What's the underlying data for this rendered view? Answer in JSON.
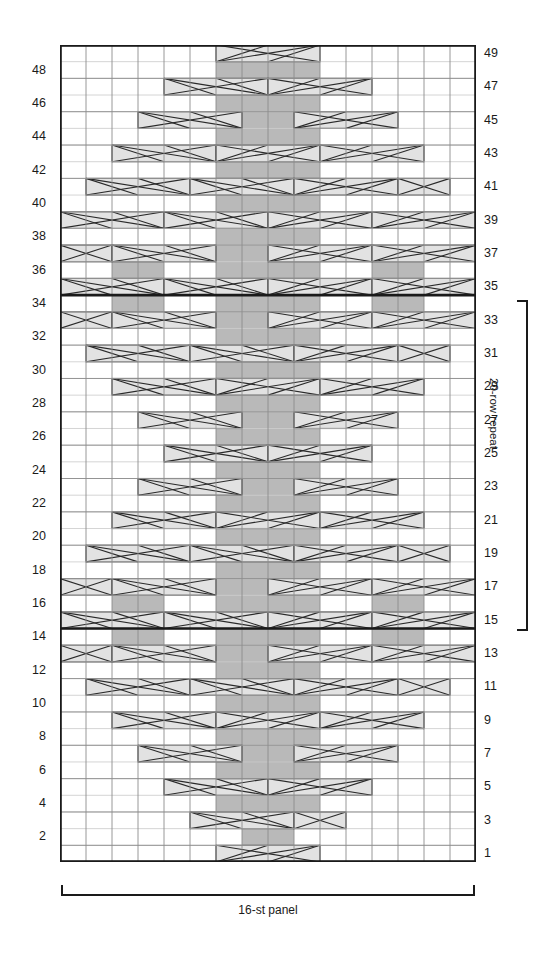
{
  "figure": {
    "kind": "knitting-cable-chart",
    "columns": 16,
    "rows": 49
  },
  "axis": {
    "left_labels": [
      48,
      46,
      44,
      42,
      40,
      38,
      36,
      34,
      32,
      30,
      28,
      26,
      24,
      22,
      20,
      18,
      16,
      14,
      12,
      10,
      8,
      6,
      4,
      2
    ],
    "right_labels": [
      49,
      47,
      45,
      43,
      41,
      39,
      37,
      35,
      33,
      31,
      29,
      27,
      25,
      23,
      21,
      19,
      17,
      15,
      13,
      11,
      9,
      7,
      5,
      3,
      1
    ]
  },
  "annotations": {
    "repeat_label": "20-row repeat",
    "panel_label": "16-st panel",
    "repeat_start_row": 15,
    "repeat_end_row": 34
  },
  "colors": {
    "grid_line": "#8c8c8c",
    "grid_line_minor": "#c9c9c9",
    "border": "#1a1a1a",
    "repeat_rule": "#1a1a1a",
    "knit_fill": "#b9b9b9",
    "cable_fill": "#e2e2e2",
    "symbol_stroke": "#2a2a2a",
    "text": "#1a1a1a",
    "background": "#ffffff"
  },
  "chart_data": {
    "type": "heatmap",
    "title": "",
    "xlabel": "16-st panel",
    "ylabel": "",
    "grid": true,
    "legend": "none",
    "columns": 16,
    "rows": 49,
    "row_order": "bottom-to-top",
    "symbol_key": {
      "blank": "purl / background stitch",
      "k": "knit stitch (shaded cell)",
      "c4f": "2-over-2 cable, left cross (4 cells)",
      "c4b": "2-over-2 cable, right cross (4 cells)",
      "t2f": "1-over-1 twist, left (2 cells)",
      "t2b": "1-over-1 twist, right (2 cells)"
    },
    "knit_cells": [
      {
        "row": 49,
        "cols": []
      },
      {
        "row": 48,
        "cols": [
          7,
          8,
          9,
          10
        ]
      },
      {
        "row": 47,
        "cols": [
          7,
          8,
          9,
          10
        ]
      },
      {
        "row": 46,
        "cols": [
          7,
          8,
          9,
          10
        ]
      },
      {
        "row": 45,
        "cols": [
          7,
          8,
          9,
          10
        ]
      },
      {
        "row": 44,
        "cols": [
          7,
          8,
          9,
          10
        ]
      },
      {
        "row": 43,
        "cols": [
          7,
          8,
          9,
          10
        ]
      },
      {
        "row": 42,
        "cols": [
          7,
          8,
          9,
          10
        ]
      },
      {
        "row": 41,
        "cols": [
          7,
          8,
          9,
          10
        ]
      },
      {
        "row": 40,
        "cols": [
          7,
          8,
          9,
          10
        ]
      },
      {
        "row": 39,
        "cols": [
          7,
          8,
          9,
          10
        ]
      },
      {
        "row": 38,
        "cols": [
          7,
          8,
          9,
          10
        ]
      },
      {
        "row": 37,
        "cols": [
          7,
          8,
          9,
          10
        ]
      },
      {
        "row": 36,
        "cols": [
          3,
          4,
          7,
          8,
          9,
          10,
          13,
          14
        ]
      },
      {
        "row": 35,
        "cols": [
          3,
          4,
          7,
          8,
          9,
          10,
          13,
          14
        ]
      },
      {
        "row": 34,
        "cols": [
          3,
          4,
          7,
          8,
          9,
          10,
          13,
          14
        ]
      },
      {
        "row": 33,
        "cols": [
          7,
          8,
          9,
          10
        ]
      },
      {
        "row": 32,
        "cols": [
          7,
          8,
          9,
          10
        ]
      },
      {
        "row": 31,
        "cols": [
          7,
          8,
          9,
          10
        ]
      },
      {
        "row": 30,
        "cols": [
          7,
          8,
          9,
          10
        ]
      },
      {
        "row": 29,
        "cols": [
          7,
          8,
          9,
          10
        ]
      },
      {
        "row": 28,
        "cols": [
          7,
          8,
          9,
          10
        ]
      },
      {
        "row": 27,
        "cols": [
          7,
          8,
          9,
          10
        ]
      },
      {
        "row": 26,
        "cols": [
          7,
          8,
          9,
          10
        ]
      },
      {
        "row": 25,
        "cols": [
          7,
          8,
          9,
          10
        ]
      },
      {
        "row": 24,
        "cols": [
          7,
          8,
          9,
          10
        ]
      },
      {
        "row": 23,
        "cols": [
          7,
          8,
          9,
          10
        ]
      },
      {
        "row": 22,
        "cols": [
          7,
          8,
          9,
          10
        ]
      },
      {
        "row": 21,
        "cols": [
          7,
          8,
          9,
          10
        ]
      },
      {
        "row": 20,
        "cols": [
          7,
          8,
          9,
          10
        ]
      },
      {
        "row": 19,
        "cols": [
          7,
          8,
          9,
          10
        ]
      },
      {
        "row": 18,
        "cols": [
          7,
          8,
          9,
          10
        ]
      },
      {
        "row": 17,
        "cols": [
          7,
          8,
          9,
          10
        ]
      },
      {
        "row": 16,
        "cols": [
          3,
          4,
          7,
          8,
          9,
          10,
          13,
          14
        ]
      },
      {
        "row": 15,
        "cols": [
          3,
          4,
          7,
          8,
          9,
          10,
          13,
          14
        ]
      },
      {
        "row": 14,
        "cols": [
          3,
          4,
          7,
          8,
          9,
          10,
          13,
          14
        ]
      },
      {
        "row": 13,
        "cols": [
          7,
          8,
          9,
          10
        ]
      },
      {
        "row": 12,
        "cols": [
          7,
          8,
          9,
          10
        ]
      },
      {
        "row": 11,
        "cols": [
          7,
          8,
          9,
          10
        ]
      },
      {
        "row": 10,
        "cols": [
          7,
          8,
          9,
          10
        ]
      },
      {
        "row": 9,
        "cols": [
          7,
          8,
          9,
          10
        ]
      },
      {
        "row": 8,
        "cols": [
          7,
          8,
          9,
          10
        ]
      },
      {
        "row": 7,
        "cols": [
          7,
          8,
          9,
          10
        ]
      },
      {
        "row": 6,
        "cols": [
          7,
          8,
          9,
          10
        ]
      },
      {
        "row": 5,
        "cols": [
          7,
          8,
          9,
          10
        ]
      },
      {
        "row": 4,
        "cols": [
          7,
          8,
          9,
          10
        ]
      },
      {
        "row": 3,
        "cols": [
          7,
          8,
          9,
          10
        ]
      },
      {
        "row": 2,
        "cols": [
          8,
          9
        ]
      },
      {
        "row": 1,
        "cols": []
      }
    ],
    "cables": [
      {
        "row": 49,
        "col": 7,
        "span": 4,
        "type": "c4b"
      },
      {
        "row": 47,
        "col": 5,
        "span": 4,
        "type": "c4f"
      },
      {
        "row": 47,
        "col": 9,
        "span": 4,
        "type": "c4b"
      },
      {
        "row": 45,
        "col": 4,
        "span": 4,
        "type": "c4f"
      },
      {
        "row": 45,
        "col": 10,
        "span": 4,
        "type": "c4b"
      },
      {
        "row": 43,
        "col": 3,
        "span": 4,
        "type": "c4f"
      },
      {
        "row": 43,
        "col": 7,
        "span": 4,
        "type": "c4b"
      },
      {
        "row": 43,
        "col": 11,
        "span": 4,
        "type": "c4b"
      },
      {
        "row": 41,
        "col": 2,
        "span": 4,
        "type": "c4f"
      },
      {
        "row": 41,
        "col": 6,
        "span": 4,
        "type": "c4f"
      },
      {
        "row": 41,
        "col": 10,
        "span": 4,
        "type": "c4b"
      },
      {
        "row": 41,
        "col": 14,
        "span": 2,
        "type": "t2b"
      },
      {
        "row": 39,
        "col": 1,
        "span": 4,
        "type": "c4f"
      },
      {
        "row": 39,
        "col": 5,
        "span": 4,
        "type": "c4f"
      },
      {
        "row": 39,
        "col": 9,
        "span": 4,
        "type": "c4b"
      },
      {
        "row": 39,
        "col": 13,
        "span": 4,
        "type": "c4b"
      },
      {
        "row": 37,
        "col": 1,
        "span": 2,
        "type": "t2f"
      },
      {
        "row": 37,
        "col": 3,
        "span": 4,
        "type": "c4f"
      },
      {
        "row": 37,
        "col": 9,
        "span": 4,
        "type": "c4b"
      },
      {
        "row": 37,
        "col": 13,
        "span": 4,
        "type": "c4b"
      },
      {
        "row": 35,
        "col": 1,
        "span": 4,
        "type": "c4f"
      },
      {
        "row": 35,
        "col": 5,
        "span": 4,
        "type": "c4f"
      },
      {
        "row": 35,
        "col": 9,
        "span": 4,
        "type": "c4b"
      },
      {
        "row": 35,
        "col": 13,
        "span": 4,
        "type": "c4b"
      },
      {
        "row": 33,
        "col": 1,
        "span": 2,
        "type": "t2f"
      },
      {
        "row": 33,
        "col": 3,
        "span": 4,
        "type": "c4f"
      },
      {
        "row": 33,
        "col": 9,
        "span": 4,
        "type": "c4b"
      },
      {
        "row": 33,
        "col": 13,
        "span": 4,
        "type": "c4b"
      },
      {
        "row": 31,
        "col": 2,
        "span": 4,
        "type": "c4f"
      },
      {
        "row": 31,
        "col": 6,
        "span": 4,
        "type": "c4f"
      },
      {
        "row": 31,
        "col": 10,
        "span": 4,
        "type": "c4b"
      },
      {
        "row": 31,
        "col": 14,
        "span": 2,
        "type": "t2b"
      },
      {
        "row": 29,
        "col": 3,
        "span": 4,
        "type": "c4f"
      },
      {
        "row": 29,
        "col": 7,
        "span": 4,
        "type": "c4b"
      },
      {
        "row": 29,
        "col": 11,
        "span": 4,
        "type": "c4b"
      },
      {
        "row": 27,
        "col": 4,
        "span": 4,
        "type": "c4f"
      },
      {
        "row": 27,
        "col": 10,
        "span": 4,
        "type": "c4b"
      },
      {
        "row": 25,
        "col": 5,
        "span": 4,
        "type": "c4f"
      },
      {
        "row": 25,
        "col": 9,
        "span": 4,
        "type": "c4b"
      },
      {
        "row": 23,
        "col": 4,
        "span": 4,
        "type": "c4f"
      },
      {
        "row": 23,
        "col": 10,
        "span": 4,
        "type": "c4b"
      },
      {
        "row": 21,
        "col": 3,
        "span": 4,
        "type": "c4f"
      },
      {
        "row": 21,
        "col": 7,
        "span": 4,
        "type": "c4b"
      },
      {
        "row": 21,
        "col": 11,
        "span": 4,
        "type": "c4b"
      },
      {
        "row": 19,
        "col": 2,
        "span": 4,
        "type": "c4f"
      },
      {
        "row": 19,
        "col": 6,
        "span": 4,
        "type": "c4f"
      },
      {
        "row": 19,
        "col": 10,
        "span": 4,
        "type": "c4b"
      },
      {
        "row": 19,
        "col": 14,
        "span": 2,
        "type": "t2b"
      },
      {
        "row": 17,
        "col": 1,
        "span": 2,
        "type": "t2f"
      },
      {
        "row": 17,
        "col": 3,
        "span": 4,
        "type": "c4f"
      },
      {
        "row": 17,
        "col": 9,
        "span": 4,
        "type": "c4b"
      },
      {
        "row": 17,
        "col": 13,
        "span": 4,
        "type": "c4b"
      },
      {
        "row": 15,
        "col": 1,
        "span": 4,
        "type": "c4f"
      },
      {
        "row": 15,
        "col": 5,
        "span": 4,
        "type": "c4f"
      },
      {
        "row": 15,
        "col": 9,
        "span": 4,
        "type": "c4b"
      },
      {
        "row": 15,
        "col": 13,
        "span": 4,
        "type": "c4b"
      },
      {
        "row": 13,
        "col": 1,
        "span": 2,
        "type": "t2f"
      },
      {
        "row": 13,
        "col": 3,
        "span": 4,
        "type": "c4f"
      },
      {
        "row": 13,
        "col": 9,
        "span": 4,
        "type": "c4b"
      },
      {
        "row": 13,
        "col": 13,
        "span": 4,
        "type": "c4b"
      },
      {
        "row": 11,
        "col": 2,
        "span": 4,
        "type": "c4f"
      },
      {
        "row": 11,
        "col": 6,
        "span": 4,
        "type": "c4f"
      },
      {
        "row": 11,
        "col": 10,
        "span": 4,
        "type": "c4b"
      },
      {
        "row": 11,
        "col": 14,
        "span": 2,
        "type": "t2b"
      },
      {
        "row": 9,
        "col": 3,
        "span": 4,
        "type": "c4f"
      },
      {
        "row": 9,
        "col": 7,
        "span": 4,
        "type": "c4b"
      },
      {
        "row": 9,
        "col": 11,
        "span": 4,
        "type": "c4b"
      },
      {
        "row": 7,
        "col": 4,
        "span": 4,
        "type": "c4f"
      },
      {
        "row": 7,
        "col": 10,
        "span": 4,
        "type": "c4b"
      },
      {
        "row": 5,
        "col": 5,
        "span": 4,
        "type": "c4f"
      },
      {
        "row": 5,
        "col": 9,
        "span": 4,
        "type": "c4b"
      },
      {
        "row": 3,
        "col": 6,
        "span": 4,
        "type": "c4f"
      },
      {
        "row": 3,
        "col": 10,
        "span": 2,
        "type": "t2b"
      },
      {
        "row": 1,
        "col": 7,
        "span": 4,
        "type": "c4b"
      }
    ],
    "repeat_rules": [
      35,
      15
    ]
  }
}
